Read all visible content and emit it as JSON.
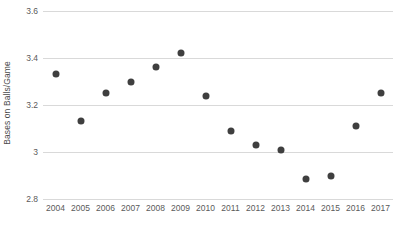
{
  "chart_data": {
    "type": "scatter",
    "title": "",
    "xlabel": "",
    "ylabel": "Bases on Balls/Game",
    "x": [
      2004,
      2005,
      2006,
      2007,
      2008,
      2009,
      2010,
      2011,
      2012,
      2013,
      2014,
      2015,
      2016,
      2017
    ],
    "values": [
      3.33,
      3.13,
      3.25,
      3.3,
      3.36,
      3.42,
      3.24,
      3.09,
      3.03,
      3.01,
      2.885,
      2.9,
      3.11,
      3.25
    ],
    "categories": [
      "2004",
      "2005",
      "2006",
      "2007",
      "2008",
      "2009",
      "2010",
      "2011",
      "2012",
      "2013",
      "2014",
      "2015",
      "2016",
      "2017"
    ],
    "xtick_labels": [
      "2004",
      "2005",
      "2006",
      "2007",
      "2008",
      "2009",
      "2010",
      "2011",
      "2012",
      "2013",
      "2014",
      "2015",
      "2016",
      "2017"
    ],
    "ytick_labels": [
      "3.6",
      "3.4",
      "3.2",
      "3",
      "2.8"
    ],
    "yticks": [
      3.6,
      3.4,
      3.2,
      3.0,
      2.8
    ],
    "ylim": [
      2.8,
      3.6
    ],
    "xlim": [
      2003.5,
      2017.5
    ],
    "grid": true,
    "grid_axis": "y",
    "legend": false,
    "marker_color": "#3f3f3f",
    "grid_color": "#d9d9d9",
    "background_color": "#ffffff",
    "text_color": "#5a5a5a",
    "series": [
      {
        "name": "Bases on Balls/Game",
        "points": [
          {
            "x": "2004",
            "y": 3.33
          },
          {
            "x": "2005",
            "y": 3.13
          },
          {
            "x": "2006",
            "y": 3.25
          },
          {
            "x": "2007",
            "y": 3.3
          },
          {
            "x": "2008",
            "y": 3.36
          },
          {
            "x": "2009",
            "y": 3.42
          },
          {
            "x": "2010",
            "y": 3.24
          },
          {
            "x": "2011",
            "y": 3.09
          },
          {
            "x": "2012",
            "y": 3.03
          },
          {
            "x": "2013",
            "y": 3.01
          },
          {
            "x": "2014",
            "y": 2.885
          },
          {
            "x": "2015",
            "y": 2.9
          },
          {
            "x": "2016",
            "y": 3.11
          },
          {
            "x": "2017",
            "y": 3.25
          }
        ]
      }
    ]
  },
  "bottom_caption": ""
}
